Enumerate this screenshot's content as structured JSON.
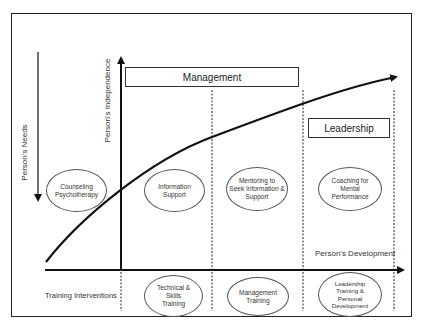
{
  "diagram": {
    "axes": {
      "vertical_left_label": "Person's Needs",
      "vertical_center_label": "Person's Independence",
      "horizontal_label": "Person's Development",
      "row_label": "Training Interventions"
    },
    "phase_boxes": {
      "management": "Management",
      "leadership": "Leadership"
    },
    "support_ellipses": [
      {
        "label": "Counseling\nPsychotherapy"
      },
      {
        "label": "Information\nSupport"
      },
      {
        "label": "Mentoring to\nSeek Information &\nSupport"
      },
      {
        "label": "Coaching for\nMental\nPerformance"
      }
    ],
    "training_ellipses": [
      {
        "label": "Technical &\nSkills\nTraining"
      },
      {
        "label": "Management\nTraining"
      },
      {
        "label": "Leadership\nTraining &\nPersonal\nDevelopment"
      }
    ],
    "colors": {
      "line": "#111111",
      "text": "#333333",
      "background": "#ffffff"
    }
  }
}
